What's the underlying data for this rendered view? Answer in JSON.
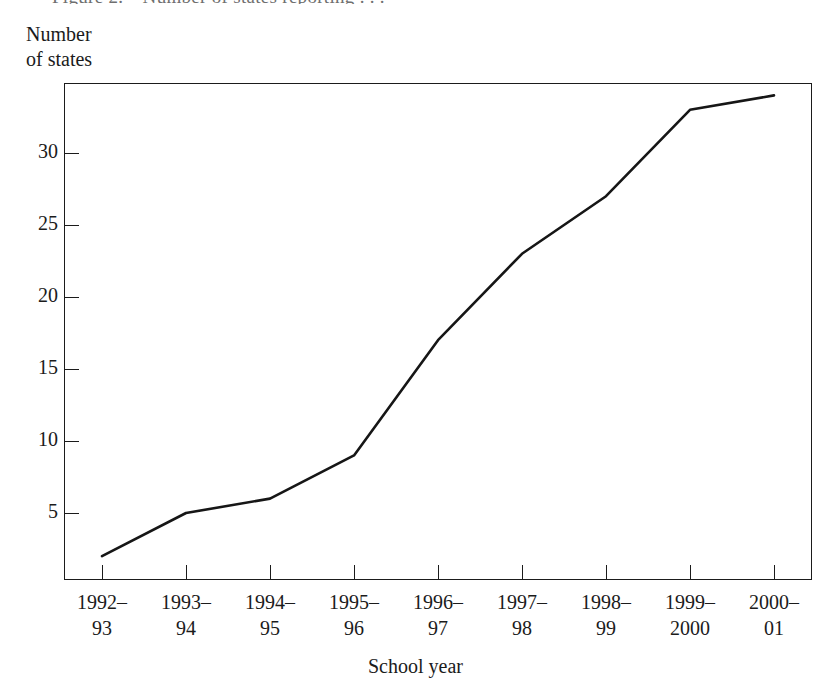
{
  "figure": {
    "caption_sliver": "Figure 2.—Number of states reporting . . .",
    "y_axis_title": "Number\nof states",
    "x_axis_title": "School year"
  },
  "chart_data": {
    "type": "line",
    "title": "",
    "xlabel": "School year",
    "ylabel": "Number of states",
    "categories": [
      "1992–\n93",
      "1993–\n94",
      "1994–\n95",
      "1995–\n96",
      "1996–\n97",
      "1997–\n98",
      "1998–\n99",
      "1999–\n2000",
      "2000–\n01"
    ],
    "x": [
      "1992-93",
      "1993-94",
      "1994-95",
      "1995-96",
      "1996-97",
      "1997-98",
      "1998-99",
      "1999-2000",
      "2000-01"
    ],
    "values": [
      2,
      5,
      6,
      9,
      17,
      23,
      27,
      33,
      34
    ],
    "ylim": [
      0,
      34.5
    ],
    "yticks": [
      5,
      10,
      15,
      20,
      25,
      30
    ],
    "ytick_labels": [
      "5",
      "10",
      "15",
      "20",
      "25",
      "30"
    ],
    "grid": false,
    "legend": false,
    "line_color": "#161616"
  },
  "colors": {
    "line": "#161616",
    "axis": "#1b1b1b",
    "background": "#ffffff"
  }
}
